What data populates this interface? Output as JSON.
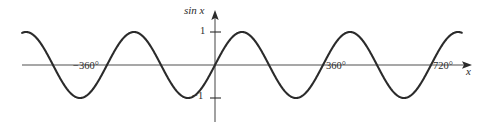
{
  "figure": {
    "name": "sine-curve-graph",
    "background": "#ffffff",
    "width": 478,
    "height": 127
  },
  "labels": {
    "y_axis_label": "sin x",
    "x_axis_label": "x",
    "y_tick_pos1": "1",
    "y_tick_neg1": "−1",
    "x_tick_minus360": "−360°",
    "x_tick_360": "360°",
    "x_tick_720": "720°"
  },
  "colors": {
    "curve": "#2b2b2b",
    "axis": "#8a8a8a",
    "text": "#2b2b2b",
    "background": "#ffffff"
  },
  "geometry": {
    "origin_x": 215,
    "origin_y": 65,
    "pixels_per_360deg": 108,
    "amplitude_px": 33,
    "x_start_deg": -643,
    "x_end_deg": 823,
    "axis_left_px": 22,
    "axis_right_px": 472,
    "y_axis_top_px": 10,
    "y_axis_bottom_px": 122
  },
  "chart_data": {
    "type": "line",
    "title": "",
    "subtitle": "",
    "xlabel": "x",
    "ylabel": "sin x",
    "function": "y = sin(x)",
    "angle_unit": "degrees",
    "grid": false,
    "legend": null,
    "xlim": [
      -643,
      823
    ],
    "ylim": [
      -1.15,
      1.15
    ],
    "xticks": [
      -360,
      360,
      720
    ],
    "xticklabels": [
      "−360°",
      "360°",
      "720°"
    ],
    "yticks": [
      -1,
      1
    ],
    "yticklabels": [
      "−1",
      "1"
    ],
    "axis_arrows": [
      "x-positive",
      "y-positive"
    ],
    "series": [
      {
        "name": "sin x",
        "color": "#2b2b2b",
        "x": [
          -643,
          -630,
          -600,
          -570,
          -540,
          -510,
          -480,
          -450,
          -420,
          -390,
          -360,
          -330,
          -300,
          -270,
          -240,
          -210,
          -180,
          -150,
          -120,
          -90,
          -60,
          -30,
          0,
          30,
          60,
          90,
          120,
          150,
          180,
          210,
          240,
          270,
          300,
          330,
          360,
          390,
          420,
          450,
          480,
          510,
          540,
          570,
          600,
          630,
          660,
          690,
          720,
          750,
          780,
          810,
          823
        ],
        "y": [
          0.574,
          0.5,
          0.0,
          -0.5,
          -0.866,
          -1.0,
          -0.866,
          -0.5,
          0.0,
          0.5,
          0.866,
          1.0,
          0.866,
          0.5,
          0.0,
          -0.5,
          -0.866,
          -1.0,
          -0.866,
          -0.5,
          0.0,
          0.5,
          0.0,
          0.5,
          0.866,
          1.0,
          0.866,
          0.5,
          0.0,
          -0.5,
          -0.866,
          -1.0,
          -0.866,
          -0.5,
          0.0,
          0.5,
          0.866,
          1.0,
          0.866,
          0.5,
          0.0,
          -0.5,
          -0.866,
          -1.0,
          -0.866,
          -0.5,
          0.0,
          0.5,
          0.866,
          1.0,
          0.996
        ],
        "maxima_deg": [
          -450,
          -90,
          270,
          630
        ],
        "minima_deg": [
          -630,
          -270,
          90,
          450,
          810
        ],
        "zeros_deg": [
          -540,
          -360,
          -180,
          0,
          180,
          360,
          540,
          720
        ],
        "amplitude": 1,
        "period_deg": 360
      }
    ]
  }
}
